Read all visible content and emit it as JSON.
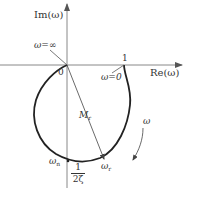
{
  "diagram": {
    "type": "nyquist-plot",
    "axes": {
      "y_label": "Im(ω)",
      "x_label": "Re(ω)"
    },
    "labels": {
      "origin": "0",
      "one": "1",
      "omega_inf": "ω=∞",
      "omega_zero": "ω=0",
      "omega_dir": "ω",
      "Mr_main": "M",
      "Mr_sub": "r",
      "omega_n_main": "ω",
      "omega_n_sub": "n",
      "omega_r_main": "ω",
      "omega_r_sub": "r",
      "frac_num": "1",
      "frac_den": "2ζ"
    },
    "colors": {
      "axis": "#777777",
      "curve": "#222222",
      "text": "#333333"
    }
  }
}
